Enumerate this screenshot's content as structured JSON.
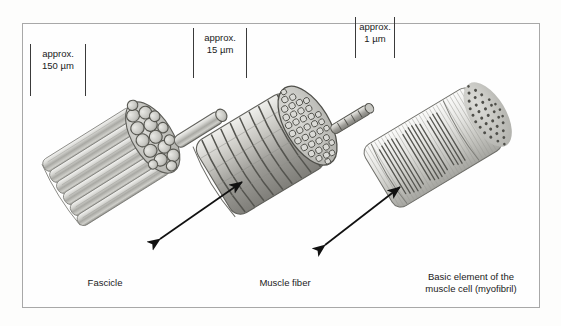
{
  "figure": {
    "background_color": "#fdfdfc",
    "frame_color": "#a8a8a8",
    "text_color": "#1a1a1a"
  },
  "scale_labels": [
    {
      "id": "fascicle-scale",
      "prefix": "approx.",
      "value": "150 µm"
    },
    {
      "id": "muscle-fiber-scale",
      "prefix": "approx.",
      "value": "15 µm"
    },
    {
      "id": "myofibril-scale",
      "prefix": "approx.",
      "value": "1 µm"
    }
  ],
  "captions": [
    {
      "id": "fascicle-caption",
      "text": "Fascicle"
    },
    {
      "id": "muscle-fiber-caption",
      "text": "Muscle fiber"
    },
    {
      "id": "myofibril-caption",
      "text": "Basic element of the\nmuscle cell (myofibril)"
    }
  ],
  "structures": [
    {
      "id": "fascicle",
      "name": "Fascicle",
      "scale": "approx. 150 µm",
      "description": "Bundle of muscle fibers shown as a cylinder of parallel longitudinal fibers with an elliptical cross-section of about 16 rounded muscle fibers, one fiber drawn extending out from the bundle.",
      "cross_section_units": 16
    },
    {
      "id": "muscle-fiber",
      "name": "Muscle fiber",
      "scale": "approx. 15 µm",
      "description": "Single striated muscle cell drawn as a banded cylinder with transverse rings and a cross-section packed with many small rounded myofibrils, one myofibril drawn extending out.",
      "cross_section_units": 40
    },
    {
      "id": "myofibril",
      "name": "Basic element of the muscle cell (myofibril)",
      "scale": "approx. 1 µm",
      "description": "Myofibril drawn as a translucent cylinder of longitudinal myofilaments with dark striation bands and a circular cross-section showing a regular lattice of filament dots.",
      "cross_section_units": 60
    }
  ],
  "connectors": [
    {
      "id": "arrow-fascicle-to-fiber",
      "type": "double-headed-arrow",
      "from": "fascicle",
      "to": "muscle-fiber"
    },
    {
      "id": "arrow-fiber-to-myofibril",
      "type": "double-headed-arrow",
      "from": "muscle-fiber",
      "to": "myofibril"
    }
  ]
}
